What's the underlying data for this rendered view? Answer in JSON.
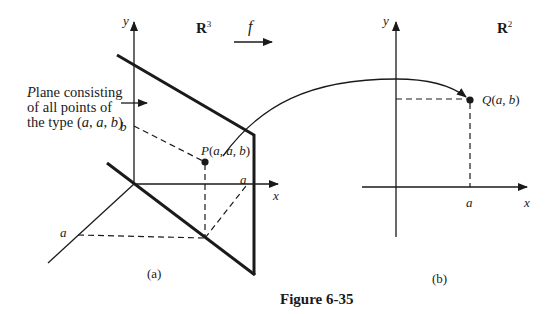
{
  "figure": {
    "caption": "Figure 6-35",
    "mapping_label": "f",
    "colors": {
      "ink": "#1a1a1a",
      "background": "#ffffff"
    }
  },
  "panel_a": {
    "space_label": "R",
    "space_exponent": "3",
    "sublabel": "(a)",
    "y_axis_label": "y",
    "x_axis_label": "x",
    "b_label": "b",
    "a_label_x": "a",
    "a_label_z": "a",
    "point_label": "P(a, a, b)",
    "annotation": "Plane consisting\nof all points of\nthe type (a, a, b)"
  },
  "panel_b": {
    "space_label": "R",
    "space_exponent": "2",
    "sublabel": "(b)",
    "y_axis_label": "y",
    "x_axis_label": "x",
    "a_label": "a",
    "point_label": "Q(a, b)"
  }
}
